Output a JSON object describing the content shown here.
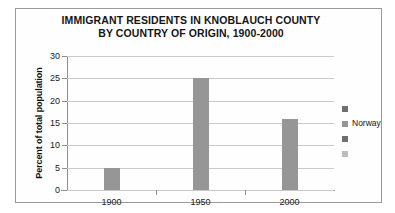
{
  "chart_data": {
    "type": "bar",
    "title": "IMMIGRANT RESIDENTS IN KNOBLAUCH COUNTY BY COUNTRY OF ORIGIN, 1900-2000",
    "title_lines": [
      "IMMIGRANT RESIDENTS IN KNOBLAUCH COUNTY",
      "BY COUNTRY OF ORIGIN, 1900-2000"
    ],
    "categories": [
      "1900",
      "1950",
      "2000"
    ],
    "series": [
      {
        "name": "Norway",
        "values": [
          5,
          25,
          16
        ],
        "color": "#969696"
      }
    ],
    "values": [
      5,
      25,
      16
    ],
    "xlabel": "",
    "ylabel": "Percent of total population",
    "ylim": [
      0,
      30
    ],
    "ytick_step": 5,
    "yticks": [
      "30",
      "25",
      "20",
      "15",
      "10",
      "5",
      "0"
    ],
    "grid": true,
    "legend_position": "right",
    "legend_entries": [
      {
        "label": "",
        "color": "#6f6f6f"
      },
      {
        "label": "Norway",
        "color": "#969696"
      },
      {
        "label": "",
        "color": "#6f6f6f"
      },
      {
        "label": "",
        "color": "#bdbdbd"
      }
    ],
    "colors": {
      "bar": "#969696",
      "gridline": "#c9c9c9",
      "axis": "#8d8d8d",
      "border": "#9a9a9a",
      "text": "#1a1a1a"
    }
  }
}
